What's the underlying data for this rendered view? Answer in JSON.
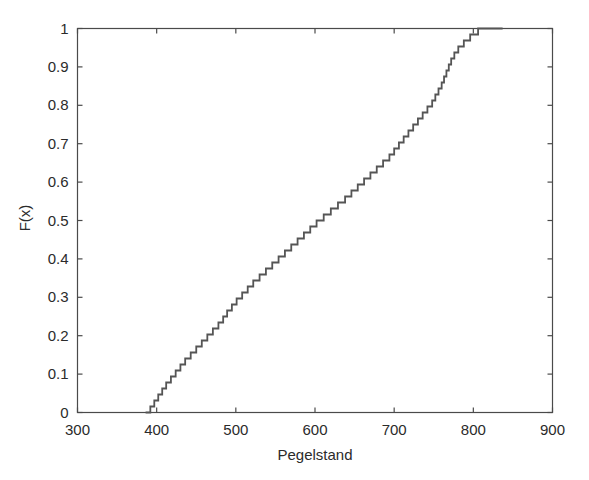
{
  "figure": {
    "background_color": "#ffffff",
    "line_color": "#555555",
    "axis_color": "#4a4a4a",
    "text_color": "#2b2b2b"
  },
  "chart_data": {
    "type": "line",
    "subtype": "empirical-cdf-step",
    "title": "",
    "subtitle": "",
    "xlabel": "Pegelstand",
    "ylabel": "F(x)",
    "xlim": [
      300,
      900
    ],
    "ylim": [
      0,
      1
    ],
    "xticks": [
      300,
      400,
      500,
      600,
      700,
      800,
      900
    ],
    "xticklabels": [
      "300",
      "400",
      "500",
      "600",
      "700",
      "800",
      "900"
    ],
    "yticks": [
      0,
      0.1,
      0.2,
      0.3,
      0.4,
      0.5,
      0.6,
      0.7,
      0.8,
      0.9,
      1
    ],
    "yticklabels": [
      "0",
      "0.1",
      "0.2",
      "0.3",
      "0.4",
      "0.5",
      "0.6",
      "0.7",
      "0.8",
      "0.9",
      "1"
    ],
    "grid": false,
    "legend": null,
    "annotations": [],
    "series": [
      {
        "name": "Pegelstand ECDF",
        "color": "#555555",
        "step": "post",
        "n_points": 64,
        "x": [
          386,
          392,
          397,
          402,
          407,
          412,
          418,
          424,
          430,
          436,
          443,
          450,
          457,
          464,
          471,
          478,
          484,
          489,
          495,
          501,
          508,
          515,
          522,
          530,
          538,
          546,
          554,
          562,
          570,
          578,
          586,
          594,
          602,
          611,
          620,
          629,
          638,
          646,
          654,
          662,
          670,
          678,
          686,
          694,
          700,
          706,
          712,
          718,
          724,
          730,
          736,
          742,
          748,
          752,
          756,
          760,
          763,
          766,
          769,
          772,
          776,
          781,
          788,
          796,
          806,
          818,
          830,
          837
        ],
        "y": [
          0.0,
          0.0156,
          0.0312,
          0.0469,
          0.0625,
          0.0781,
          0.0938,
          0.1094,
          0.125,
          0.1406,
          0.1562,
          0.1719,
          0.1875,
          0.2031,
          0.2188,
          0.2344,
          0.25,
          0.2656,
          0.2812,
          0.2969,
          0.3125,
          0.3281,
          0.3438,
          0.3594,
          0.375,
          0.3906,
          0.4062,
          0.4219,
          0.4375,
          0.4531,
          0.4688,
          0.4844,
          0.5,
          0.5156,
          0.5312,
          0.5469,
          0.5625,
          0.5781,
          0.5938,
          0.6094,
          0.625,
          0.6406,
          0.6562,
          0.6719,
          0.6875,
          0.7031,
          0.7188,
          0.7344,
          0.75,
          0.7656,
          0.7812,
          0.7969,
          0.8125,
          0.8281,
          0.8438,
          0.8594,
          0.875,
          0.8906,
          0.9062,
          0.9219,
          0.9375,
          0.9531,
          0.9688,
          0.9844,
          1.0,
          1.0,
          1.0,
          1.0
        ]
      }
    ],
    "description_points": {
      "min_value": 386,
      "max_value": 837,
      "median_approx": 715
    }
  }
}
